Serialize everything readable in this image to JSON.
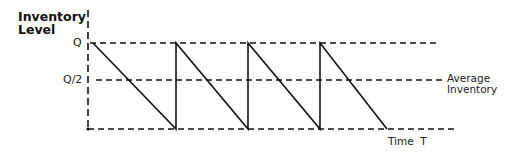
{
  "diagram": {
    "title_y": [
      "Inventory",
      "Level"
    ],
    "y_ticks": {
      "q": "Q",
      "half_q": "Q/2"
    },
    "annotations": {
      "average_inventory": [
        "Average",
        "Inventory"
      ],
      "x_label": "Time  T"
    },
    "colors": {
      "line": "#111111",
      "background": "#ffffff"
    },
    "levels": {
      "Q": 1.0,
      "Q/2": 0.5,
      "zero": 0
    },
    "cycles": 4
  }
}
